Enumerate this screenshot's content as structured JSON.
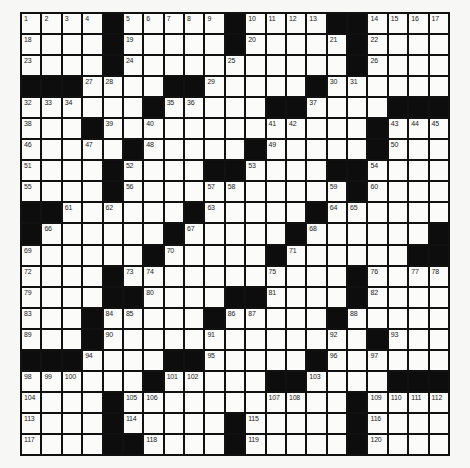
{
  "puzzle": {
    "rows": 21,
    "cols": 21,
    "colors": {
      "block": "#0d0d0d",
      "cell": "#fbfbfa",
      "grid_line": "#111111",
      "number_text": "#222222"
    },
    "grid": [
      [
        "1",
        "2",
        "3",
        "4",
        "#",
        "5",
        "6",
        "7",
        "8",
        "9",
        "#",
        "10",
        "11",
        "12",
        "13",
        "#",
        "#",
        "14",
        "15",
        "16",
        "17"
      ],
      [
        "18",
        ".",
        ".",
        ".",
        "#",
        "19",
        ".",
        ".",
        ".",
        ".",
        "#",
        "20",
        ".",
        ".",
        ".",
        "21",
        "#",
        "22",
        ".",
        ".",
        "."
      ],
      [
        "23",
        ".",
        ".",
        ".",
        "#",
        "24",
        ".",
        ".",
        ".",
        ".",
        "25",
        ".",
        ".",
        ".",
        ".",
        ".",
        "#",
        "26",
        ".",
        ".",
        "."
      ],
      [
        "#",
        "#",
        "#",
        "27",
        "28",
        ".",
        ".",
        "#",
        "#",
        "29",
        ".",
        ".",
        ".",
        ".",
        "#",
        "30",
        "31",
        ".",
        ".",
        ".",
        "."
      ],
      [
        "32",
        "33",
        "34",
        ".",
        ".",
        ".",
        "#",
        "35",
        "36",
        ".",
        ".",
        ".",
        "#",
        "#",
        "37",
        ".",
        ".",
        ".",
        "#",
        "#",
        "#"
      ],
      [
        "38",
        ".",
        ".",
        "#",
        "39",
        ".",
        "40",
        ".",
        ".",
        ".",
        ".",
        ".",
        "41",
        "42",
        ".",
        ".",
        ".",
        "#",
        "43",
        "44",
        "45"
      ],
      [
        "46",
        ".",
        ".",
        "47",
        ".",
        "#",
        "48",
        ".",
        ".",
        ".",
        ".",
        "#",
        "49",
        ".",
        ".",
        ".",
        ".",
        "#",
        "50",
        ".",
        "."
      ],
      [
        "51",
        ".",
        ".",
        ".",
        "#",
        "52",
        ".",
        ".",
        ".",
        "#",
        "#",
        "53",
        ".",
        ".",
        ".",
        "#",
        "#",
        "54",
        ".",
        ".",
        "."
      ],
      [
        "55",
        ".",
        ".",
        ".",
        "#",
        "56",
        ".",
        ".",
        ".",
        "57",
        "58",
        ".",
        ".",
        ".",
        ".",
        "59",
        "#",
        "60",
        ".",
        ".",
        "."
      ],
      [
        "#",
        "#",
        "61",
        ".",
        "62",
        ".",
        ".",
        ".",
        "#",
        "63",
        ".",
        ".",
        ".",
        ".",
        "#",
        "64",
        "65",
        ".",
        ".",
        ".",
        "."
      ],
      [
        "#",
        "66",
        ".",
        ".",
        ".",
        ".",
        ".",
        "#",
        "67",
        ".",
        ".",
        ".",
        ".",
        "#",
        "68",
        ".",
        ".",
        ".",
        ".",
        ".",
        "#"
      ],
      [
        "69",
        ".",
        ".",
        ".",
        ".",
        ".",
        "#",
        "70",
        ".",
        ".",
        ".",
        ".",
        "#",
        "71",
        ".",
        ".",
        ".",
        ".",
        ".",
        "#",
        "#"
      ],
      [
        "72",
        ".",
        ".",
        ".",
        "#",
        "73",
        "74",
        ".",
        ".",
        ".",
        ".",
        ".",
        "75",
        ".",
        ".",
        ".",
        "#",
        "76",
        ".",
        "77",
        "78"
      ],
      [
        "79",
        ".",
        ".",
        ".",
        "#",
        "#",
        "80",
        ".",
        ".",
        ".",
        "#",
        "#",
        "81",
        ".",
        ".",
        ".",
        "#",
        "82",
        ".",
        ".",
        "."
      ],
      [
        "83",
        ".",
        ".",
        "#",
        "84",
        "85",
        ".",
        ".",
        ".",
        "#",
        "86",
        "87",
        ".",
        ".",
        ".",
        "#",
        "88",
        ".",
        ".",
        ".",
        "."
      ],
      [
        "89",
        ".",
        ".",
        "#",
        "90",
        ".",
        ".",
        ".",
        ".",
        "91",
        ".",
        ".",
        ".",
        ".",
        ".",
        "92",
        ".",
        "#",
        "93",
        ".",
        "."
      ],
      [
        "#",
        "#",
        "#",
        "94",
        ".",
        ".",
        ".",
        "#",
        "#",
        "95",
        ".",
        ".",
        ".",
        ".",
        "#",
        "96",
        ".",
        "97",
        ".",
        ".",
        "."
      ],
      [
        "98",
        "99",
        "100",
        ".",
        ".",
        ".",
        "#",
        "101",
        "102",
        ".",
        ".",
        ".",
        "#",
        "#",
        "103",
        ".",
        ".",
        ".",
        "#",
        "#",
        "#"
      ],
      [
        "104",
        ".",
        ".",
        ".",
        "#",
        "105",
        "106",
        ".",
        ".",
        ".",
        ".",
        ".",
        "107",
        "108",
        ".",
        ".",
        "#",
        "109",
        "110",
        "111",
        "112"
      ],
      [
        "113",
        ".",
        ".",
        ".",
        "#",
        "114",
        ".",
        ".",
        ".",
        ".",
        "#",
        "115",
        ".",
        ".",
        ".",
        ".",
        "#",
        "116",
        ".",
        ".",
        "."
      ],
      [
        "117",
        ".",
        ".",
        ".",
        "#",
        "#",
        "118",
        ".",
        ".",
        ".",
        "#",
        "119",
        ".",
        ".",
        ".",
        ".",
        "#",
        "120",
        ".",
        ".",
        "."
      ]
    ]
  }
}
